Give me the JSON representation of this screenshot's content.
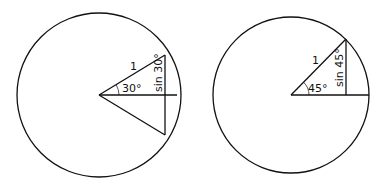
{
  "diagrams": [
    {
      "id": "left",
      "angle_label": "30°",
      "radius_label": "1",
      "sine_label": "sin 30°"
    },
    {
      "id": "right",
      "angle_label": "45°",
      "radius_label": "1",
      "sine_label": "sin 45°"
    }
  ],
  "colors": {
    "stroke": "#111111",
    "background": "#ffffff"
  }
}
